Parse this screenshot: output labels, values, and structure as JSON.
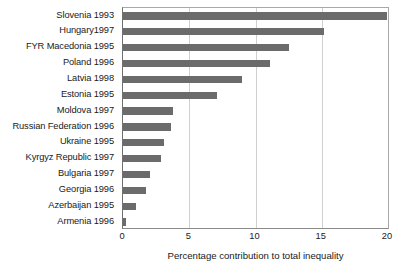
{
  "chart_data": {
    "type": "bar",
    "orientation": "horizontal",
    "title": "",
    "subtitle": "",
    "xlabel": "Percentage contribution to total inequality",
    "ylabel": "",
    "xlim": [
      0,
      20
    ],
    "xticks": [
      0,
      5,
      10,
      15,
      20
    ],
    "xtick_labels": [
      "0",
      "5",
      "10",
      "15",
      "20"
    ],
    "grid": true,
    "grid_axis": "x",
    "legend": false,
    "bar_color": "#6b6b6b",
    "categories": [
      "Slovenia 1993",
      "Hungary1997",
      "FYR Macedonia 1995",
      "Poland 1996",
      "Latvia 1998",
      "Estonia 1995",
      "Moldova 1997",
      "Russian Federation 1996",
      "Ukraine 1995",
      "Kyrgyz Republic 1997",
      "Bulgaria 1997",
      "Georgia 1996",
      "Azerbaijan 1995",
      "Armenia 1996"
    ],
    "values": [
      19.9,
      15.2,
      12.5,
      11.1,
      9.0,
      7.1,
      3.8,
      3.6,
      3.1,
      2.9,
      2.0,
      1.7,
      1.0,
      0.2
    ]
  }
}
